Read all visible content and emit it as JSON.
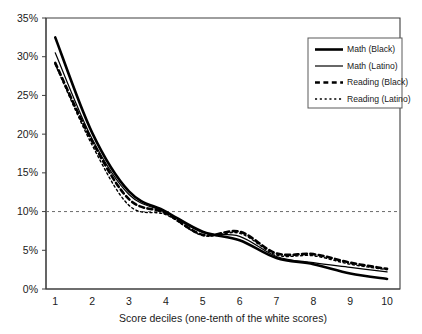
{
  "chart_data": {
    "type": "line",
    "title": "",
    "xlabel": "Score deciles (one-tenth of the white scores)",
    "ylabel": "",
    "x": [
      1,
      2,
      3,
      4,
      5,
      6,
      7,
      8,
      9,
      10
    ],
    "categories": [
      "1",
      "2",
      "3",
      "4",
      "5",
      "6",
      "7",
      "8",
      "9",
      "10"
    ],
    "xlim": [
      0.75,
      10.35
    ],
    "ylim": [
      0,
      35
    ],
    "ytick_values": [
      0,
      5,
      10,
      15,
      20,
      25,
      30,
      35
    ],
    "ytick_labels": [
      "0%",
      "5%",
      "10%",
      "15%",
      "20%",
      "25%",
      "30%",
      "35%"
    ],
    "xtick_labels": [
      "1",
      "2",
      "3",
      "4",
      "5",
      "6",
      "7",
      "8",
      "9",
      "10"
    ],
    "grid": false,
    "reference_line": {
      "value": 10,
      "label": "10%",
      "style": "dashed",
      "orientation": "horizontal"
    },
    "legend_position": "top-right",
    "series": [
      {
        "name": "Math (Black)",
        "style": "solid",
        "width": 2.6,
        "color": "#000000",
        "values": [
          32.5,
          20.2,
          12.6,
          10.0,
          7.4,
          6.3,
          4.0,
          3.2,
          2.0,
          1.3
        ]
      },
      {
        "name": "Math (Latino)",
        "style": "solid",
        "width": 1.2,
        "color": "#000000",
        "values": [
          30.5,
          19.4,
          12.2,
          9.9,
          7.3,
          6.8,
          4.2,
          3.4,
          2.8,
          2.2
        ]
      },
      {
        "name": "Reading (Black)",
        "style": "dashed",
        "width": 2.6,
        "color": "#000000",
        "values": [
          29.2,
          19.1,
          11.6,
          9.8,
          7.0,
          7.4,
          4.6,
          4.5,
          3.4,
          2.6
        ]
      },
      {
        "name": "Reading (Latino)",
        "style": "dotted",
        "width": 1.4,
        "color": "#000000",
        "values": [
          29.0,
          18.6,
          10.8,
          9.6,
          6.9,
          7.2,
          4.4,
          4.3,
          3.2,
          2.5
        ]
      }
    ]
  },
  "legend": {
    "items": [
      {
        "label": "Math (Black)"
      },
      {
        "label": "Math (Latino)"
      },
      {
        "label": "Reading (Black)"
      },
      {
        "label": "Reading (Latino)"
      }
    ]
  },
  "axis": {
    "x_title": "Score deciles (one-tenth of the white scores)"
  }
}
